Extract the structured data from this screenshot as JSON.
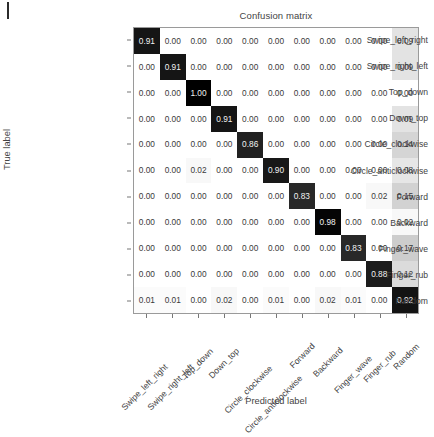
{
  "figure": {
    "title": "Confusion matrix",
    "xlabel": "Predicted label",
    "ylabel": "True label"
  },
  "chart_data": {
    "type": "heatmap",
    "title": "Confusion matrix",
    "xlabel": "Predicted label",
    "ylabel": "True label",
    "grid": false,
    "legend": "none",
    "colormap": "Greys",
    "value_range": [
      0.0,
      1.0
    ],
    "normalized": true,
    "categories": [
      "Swipe_left_right",
      "Swipe_right_left",
      "Top_down",
      "Down_top",
      "Circle_clockwise",
      "Circle_anticlockwise",
      "Forward",
      "Backward",
      "Finger_wave",
      "Finger_rub",
      "Random"
    ],
    "row_labels": [
      "Swipe_left_right",
      "Swipe_right_left",
      "Top_down",
      "Down_top",
      "Circle_clockwise",
      "Circle_anticlockwise",
      "Forward",
      "Backward",
      "Finger_wave",
      "Finger_rub",
      "Random"
    ],
    "column_labels": [
      "Swipe_left_right",
      "Swipe_right_left",
      "Top_down",
      "Down_top",
      "Circle_clockwise",
      "Circle_anticlockwise",
      "Forward",
      "Backward",
      "Finger_wave",
      "Finger_rub",
      "Random"
    ],
    "matrix": [
      [
        0.91,
        0.0,
        0.0,
        0.0,
        0.0,
        0.0,
        0.0,
        0.0,
        0.0,
        0.0,
        0.09
      ],
      [
        0.0,
        0.91,
        0.0,
        0.0,
        0.0,
        0.0,
        0.0,
        0.0,
        0.0,
        0.0,
        0.09
      ],
      [
        0.0,
        0.0,
        1.0,
        0.0,
        0.0,
        0.0,
        0.0,
        0.0,
        0.0,
        0.0,
        0.0
      ],
      [
        0.0,
        0.0,
        0.0,
        0.91,
        0.0,
        0.0,
        0.0,
        0.0,
        0.0,
        0.0,
        0.09
      ],
      [
        0.0,
        0.0,
        0.0,
        0.0,
        0.86,
        0.0,
        0.0,
        0.0,
        0.0,
        0.0,
        0.14
      ],
      [
        0.0,
        0.0,
        0.02,
        0.0,
        0.0,
        0.9,
        0.0,
        0.0,
        0.0,
        0.0,
        0.08
      ],
      [
        0.0,
        0.0,
        0.0,
        0.0,
        0.0,
        0.0,
        0.83,
        0.0,
        0.0,
        0.02,
        0.15
      ],
      [
        0.0,
        0.0,
        0.0,
        0.0,
        0.0,
        0.0,
        0.0,
        0.98,
        0.0,
        0.0,
        0.02
      ],
      [
        0.0,
        0.0,
        0.0,
        0.0,
        0.0,
        0.0,
        0.0,
        0.0,
        0.83,
        0.0,
        0.17
      ],
      [
        0.0,
        0.0,
        0.0,
        0.0,
        0.0,
        0.0,
        0.0,
        0.0,
        0.0,
        0.88,
        0.12
      ],
      [
        0.01,
        0.01,
        0.0,
        0.02,
        0.0,
        0.01,
        0.0,
        0.02,
        0.01,
        0.0,
        0.92
      ]
    ],
    "cell_text": [
      [
        "0.91",
        "0.00",
        "0.00",
        "0.00",
        "0.00",
        "0.00",
        "0.00",
        "0.00",
        "0.00",
        "0.00",
        "0.09"
      ],
      [
        "0.00",
        "0.91",
        "0.00",
        "0.00",
        "0.00",
        "0.00",
        "0.00",
        "0.00",
        "0.00",
        "0.00",
        "0.09"
      ],
      [
        "0.00",
        "0.00",
        "1.00",
        "0.00",
        "0.00",
        "0.00",
        "0.00",
        "0.00",
        "0.00",
        "0.00",
        "0.00"
      ],
      [
        "0.00",
        "0.00",
        "0.00",
        "0.91",
        "0.00",
        "0.00",
        "0.00",
        "0.00",
        "0.00",
        "0.00",
        "0.09"
      ],
      [
        "0.00",
        "0.00",
        "0.00",
        "0.00",
        "0.86",
        "0.00",
        "0.00",
        "0.00",
        "0.00",
        "0.00",
        "0.14"
      ],
      [
        "0.00",
        "0.00",
        "0.02",
        "0.00",
        "0.00",
        "0.90",
        "0.00",
        "0.00",
        "0.00",
        "0.00",
        "0.08"
      ],
      [
        "0.00",
        "0.00",
        "0.00",
        "0.00",
        "0.00",
        "0.00",
        "0.83",
        "0.00",
        "0.00",
        "0.02",
        "0.15"
      ],
      [
        "0.00",
        "0.00",
        "0.00",
        "0.00",
        "0.00",
        "0.00",
        "0.00",
        "0.98",
        "0.00",
        "0.00",
        "0.02"
      ],
      [
        "0.00",
        "0.00",
        "0.00",
        "0.00",
        "0.00",
        "0.00",
        "0.00",
        "0.00",
        "0.83",
        "0.00",
        "0.17"
      ],
      [
        "0.00",
        "0.00",
        "0.00",
        "0.00",
        "0.00",
        "0.00",
        "0.00",
        "0.00",
        "0.00",
        "0.88",
        "0.12"
      ],
      [
        "0.01",
        "0.01",
        "0.00",
        "0.02",
        "0.00",
        "0.01",
        "0.00",
        "0.02",
        "0.01",
        "0.00",
        "0.92"
      ]
    ]
  },
  "colors": {
    "cell_low": "#ffffff",
    "cell_high": "#1a1a1a",
    "text_dark": "#3a3a3a",
    "text_light": "#f2f2f2",
    "axis": "#9a9a9a"
  }
}
